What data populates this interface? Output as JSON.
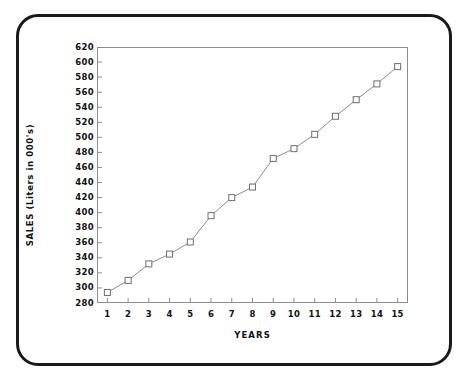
{
  "chart_data": {
    "type": "line",
    "title": "",
    "xlabel": "YEARS",
    "ylabel": "SALES (Liters in 000's)",
    "x": [
      1,
      2,
      3,
      4,
      5,
      6,
      7,
      8,
      9,
      10,
      11,
      12,
      13,
      14,
      15
    ],
    "values": [
      294,
      310,
      332,
      345,
      361,
      396,
      420,
      434,
      472,
      485,
      504,
      528,
      550,
      571,
      594
    ],
    "series": [
      {
        "name": "SALES",
        "values": [
          294,
          310,
          332,
          345,
          361,
          396,
          420,
          434,
          472,
          485,
          504,
          528,
          550,
          571,
          594
        ]
      }
    ],
    "xtick_labels": [
      "1",
      "2",
      "3",
      "4",
      "5",
      "6",
      "7",
      "8",
      "9",
      "10",
      "11",
      "12",
      "13",
      "14",
      "15"
    ],
    "ytick_labels": [
      "280",
      "300",
      "320",
      "340",
      "360",
      "380",
      "400",
      "420",
      "440",
      "460",
      "480",
      "500",
      "520",
      "540",
      "560",
      "580",
      "600",
      "620"
    ],
    "yticks": [
      280,
      300,
      320,
      340,
      360,
      380,
      400,
      420,
      440,
      460,
      480,
      500,
      520,
      540,
      560,
      580,
      600,
      620
    ],
    "xlim": [
      0.5,
      15.5
    ],
    "ylim": [
      280,
      620
    ],
    "grid": false,
    "legend": null,
    "marker": "open-square",
    "line_color": "#8d8d8d",
    "marker_color": "#6e6e6e",
    "axis_color": "#8d8d8d",
    "text_color": "#111111",
    "frame_color": "#1a1a1a",
    "background": "#ffffff"
  }
}
